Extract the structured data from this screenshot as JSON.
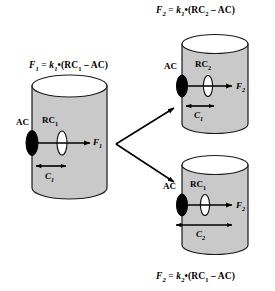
{
  "figure": {
    "type": "schematic-diagram",
    "background_color": "#ffffff",
    "cylinder_fill": "#c9c9c9",
    "cylinder_stroke": "#1a1a1a",
    "top_ellipse_fill": "#ffffff",
    "marker_ac_color": "#000000",
    "marker_rc_fill": "#ffffff"
  },
  "formulas": {
    "left": {
      "lhs": "F",
      "lhs_sub": "1",
      "k": "k",
      "k_sub": "1",
      "rc": "RC",
      "rc_sub": "1",
      "ac": "AC",
      "text": "F1 = k1•(RC1 - AC)"
    },
    "top": {
      "lhs": "F",
      "lhs_sub": "2",
      "k": "k",
      "k_sub": "1",
      "rc": "RC",
      "rc_sub": "2",
      "ac": "AC",
      "text": "F2 = k1•(RC2 - AC)"
    },
    "bottom": {
      "lhs": "F",
      "lhs_sub": "2",
      "k": "k",
      "k_sub": "2",
      "rc": "RC",
      "rc_sub": "1",
      "ac": "AC",
      "text": "F2 = k2•(RC1 - AC)"
    }
  },
  "cylinders": [
    {
      "id": "left",
      "ac_label": "AC",
      "rc_label": "RC",
      "rc_sub": "1",
      "force_label": "F",
      "force_sub": "1",
      "distance_label": "C",
      "distance_sub": "1",
      "distance_span_px": 30
    },
    {
      "id": "top-right",
      "ac_label": "AC",
      "rc_label": "RC",
      "rc_sub": "2",
      "force_label": "F",
      "force_sub": "2",
      "distance_label": "C",
      "distance_sub": "1",
      "distance_span_px": 30
    },
    {
      "id": "bottom-right",
      "ac_label": "AC",
      "rc_label": "RC",
      "rc_sub": "1",
      "force_label": "F",
      "force_sub": "2",
      "distance_label": "C",
      "distance_sub": "2",
      "distance_span_px": 56
    }
  ],
  "connector": {
    "kind": "branching-arrow",
    "branches": 2,
    "from": "left",
    "to": [
      "top-right",
      "bottom-right"
    ]
  }
}
